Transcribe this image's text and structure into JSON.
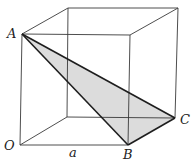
{
  "diagram": {
    "type": "cube-with-triangle",
    "labels": {
      "A": "A",
      "B": "B",
      "C": "C",
      "O": "O",
      "edge": "a"
    },
    "colors": {
      "edge": "#333333",
      "triangle_fill": "#d9d9d9",
      "triangle_edge": "#222222"
    }
  }
}
